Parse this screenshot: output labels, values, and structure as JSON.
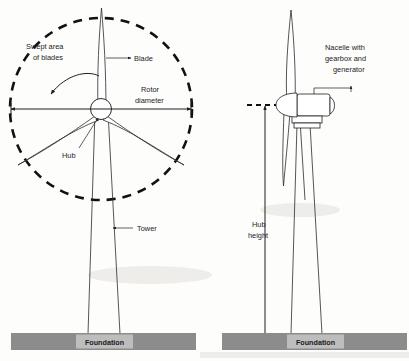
{
  "figure": {
    "background_color": "#fdfdfc",
    "line_color": "#2b2b2b"
  },
  "colors": {
    "foundation_bar": "#8c8c8c",
    "foundation_inner": "#bdbdbd",
    "ink": "#2b2b2b",
    "dash_ink": "#111111"
  },
  "left_turbine": {
    "view": "front view",
    "labels": {
      "swept_area_line1": "Swept area",
      "swept_area_line2": "of blades",
      "blade": "Blade",
      "rotor_diameter_line1": "Rotor",
      "rotor_diameter_line2": "diameter",
      "hub": "Hub",
      "tower": "Tower",
      "foundation": "Foundation"
    }
  },
  "right_turbine": {
    "view": "side view",
    "labels": {
      "nacelle_line1": "Nacelle with",
      "nacelle_line2": "gearbox and",
      "nacelle_line3": "generator",
      "hub_height_line1": "Hub",
      "hub_height_line2": "height",
      "foundation": "Foundation"
    }
  }
}
